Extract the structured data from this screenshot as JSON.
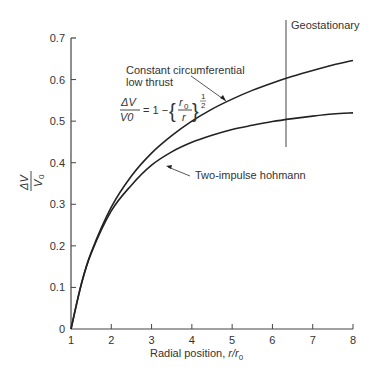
{
  "chart_data": {
    "type": "line",
    "title": "",
    "xlabel": "Radial position, r/r0",
    "ylabel": "ΔV/V0",
    "xlim": [
      1,
      8
    ],
    "ylim": [
      0,
      0.7
    ],
    "x_ticks": [
      "1",
      "2",
      "3",
      "4",
      "5",
      "6",
      "7",
      "8"
    ],
    "y_ticks": [
      "0",
      "0.1",
      "0.2",
      "0.3",
      "0.4",
      "0.5",
      "0.6",
      "0.7"
    ],
    "grid": false,
    "x": [
      1,
      1.25,
      1.5,
      2,
      2.5,
      3,
      3.5,
      4,
      4.5,
      5,
      5.5,
      6,
      6.5,
      7,
      7.5,
      8
    ],
    "series": [
      {
        "name": "Constant circumferential low thrust",
        "values": [
          0,
          0.106,
          0.184,
          0.293,
          0.368,
          0.423,
          0.465,
          0.5,
          0.529,
          0.553,
          0.574,
          0.592,
          0.608,
          0.622,
          0.635,
          0.646
        ]
      },
      {
        "name": "Two-impulse hohmann",
        "values": [
          0,
          0.105,
          0.182,
          0.284,
          0.346,
          0.394,
          0.426,
          0.449,
          0.466,
          0.48,
          0.49,
          0.499,
          0.506,
          0.512,
          0.517,
          0.52
        ]
      }
    ],
    "annotations": [
      {
        "text": "Geostationary",
        "x": 6.35,
        "type": "vertical-line"
      },
      {
        "text": "Constant circumferential",
        "line2": "low thrust",
        "target_series": 0
      },
      {
        "text": "ΔV/V0 = 1 − {r0/r}^(1/2)",
        "type": "equation"
      },
      {
        "text": "Two-impulse hohmann",
        "target_series": 1
      }
    ]
  },
  "labels": {
    "geo": "Geostationary",
    "low_thrust_1": "Constant circumferential",
    "low_thrust_2": "low thrust",
    "hohmann": "Two-impulse hohmann",
    "xlabel_main": "Radial position, ",
    "xlabel_var": "r/r",
    "xlabel_sub": "0",
    "eq_dv": "ΔV",
    "eq_v0": "V0",
    "eq_rhs": "= 1 −",
    "eq_r0": "r",
    "eq_r0_sub": "0",
    "eq_r": "r",
    "eq_exp_num": "1",
    "eq_exp_den": "2",
    "ylab_num": "ΔV",
    "ylab_den": "V",
    "ylab_sub": "0"
  }
}
